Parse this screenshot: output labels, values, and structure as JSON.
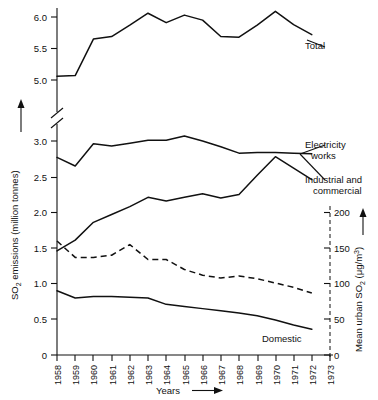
{
  "chart_data": {
    "type": "line",
    "title": "",
    "xlabel": "Years",
    "ylabel": "SO2 emissions (million tonnes)",
    "ylabel_right": "Mean urban SO2 (μg/m3)",
    "x": [
      1958,
      1959,
      1960,
      1961,
      1962,
      1963,
      1964,
      1965,
      1966,
      1967,
      1968,
      1969,
      1970,
      1971,
      1972,
      1973
    ],
    "xticklabels": [
      "1958",
      "1959",
      "1960",
      "1961",
      "1962",
      "1963",
      "1964",
      "1965",
      "1966",
      "1967",
      "1968",
      "1969",
      "1970",
      "1971",
      "1972",
      "1973"
    ],
    "yticklabels_left": [
      "0",
      "0.5",
      "1.0",
      "1.5",
      "2.0",
      "2.5",
      "3.0",
      "5.0",
      "5.5",
      "6.0"
    ],
    "yticklabels_right": [
      "0",
      "50",
      "100",
      "150",
      "200"
    ],
    "ylim_lower_segment": [
      0,
      3.2
    ],
    "ylim_upper_segment": [
      4.85,
      6.2
    ],
    "ylim_right": [
      0,
      200
    ],
    "axis_break": true,
    "grid": false,
    "legend_position": "inline-annotations",
    "series": [
      {
        "name": "Total",
        "style": "solid",
        "axis": "left",
        "values": [
          5.06,
          5.07,
          5.65,
          5.69,
          5.87,
          6.06,
          5.91,
          6.03,
          5.95,
          5.69,
          5.68,
          5.87,
          6.09,
          5.88,
          5.72,
          null
        ]
      },
      {
        "name": "Electricity works",
        "style": "solid",
        "axis": "left",
        "values": [
          2.77,
          2.65,
          2.96,
          2.93,
          2.97,
          3.01,
          3.01,
          3.07,
          3.0,
          2.92,
          2.83,
          2.84,
          2.84,
          2.83,
          2.82,
          null
        ]
      },
      {
        "name": "Industrial and commercial",
        "style": "solid",
        "axis": "left",
        "values": [
          1.46,
          1.61,
          1.86,
          1.97,
          2.08,
          2.21,
          2.16,
          2.21,
          2.26,
          2.2,
          2.25,
          2.52,
          2.78,
          2.62,
          2.46,
          null
        ]
      },
      {
        "name": "Domestic",
        "style": "solid",
        "axis": "left",
        "values": [
          0.9,
          0.8,
          0.82,
          0.82,
          0.81,
          0.8,
          0.71,
          0.68,
          0.65,
          0.62,
          0.59,
          0.55,
          0.49,
          0.42,
          0.36,
          null
        ]
      },
      {
        "name": "Mean urban SO2",
        "style": "dashed",
        "axis": "right",
        "values": [
          160,
          137,
          137,
          140,
          155,
          134,
          134,
          120,
          112,
          108,
          111,
          107,
          101,
          95,
          87,
          null
        ]
      }
    ],
    "annotations": [
      {
        "text": "Total",
        "series": "Total"
      },
      {
        "text": "Electricity",
        "series": "Electricity works"
      },
      {
        "text": "works",
        "series": "Electricity works"
      },
      {
        "text": "Industrial and",
        "series": "Industrial and commercial"
      },
      {
        "text": "commercial",
        "series": "Industrial and commercial"
      },
      {
        "text": "Domestic",
        "series": "Domestic"
      }
    ]
  },
  "labels": {
    "y_axis_title_part1": "SO",
    "y_axis_title_sub": "2",
    "y_axis_title_part2": " emissions (million tonnes)",
    "y_axis_right_title_part1": "Mean urban SO",
    "y_axis_right_title_sub": "2",
    "y_axis_right_title_part2": "  (μg/m",
    "y_axis_right_title_sup": "3",
    "y_axis_right_title_end": ")",
    "x_axis_title": "Years",
    "ann_total": "Total",
    "ann_electricity_1": "Electricity",
    "ann_electricity_2": "works",
    "ann_industrial_1": "Industrial and",
    "ann_industrial_2": "commercial",
    "ann_domestic": "Domestic",
    "ytick_0": "0",
    "ytick_05": "0.5",
    "ytick_10": "1.0",
    "ytick_15": "1.5",
    "ytick_20": "2.0",
    "ytick_25": "2.5",
    "ytick_30": "3.0",
    "ytick_50": "5.0",
    "ytick_55": "5.5",
    "ytick_60": "6.0",
    "rtick_0": "0",
    "rtick_50": "50",
    "rtick_100": "100",
    "rtick_150": "150",
    "rtick_200": "200",
    "xtick_1958": "1958",
    "xtick_1959": "1959",
    "xtick_1960": "1960",
    "xtick_1961": "1961",
    "xtick_1962": "1962",
    "xtick_1963": "1963",
    "xtick_1964": "1964",
    "xtick_1965": "1965",
    "xtick_1966": "1966",
    "xtick_1967": "1967",
    "xtick_1968": "1968",
    "xtick_1969": "1969",
    "xtick_1970": "1970",
    "xtick_1971": "1971",
    "xtick_1972": "1972",
    "xtick_1973": "1973"
  },
  "colors": {
    "ink": "#111111",
    "background": "#ffffff"
  }
}
